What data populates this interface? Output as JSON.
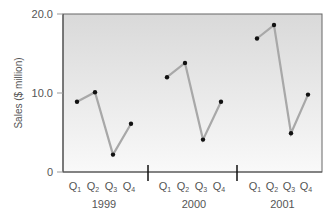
{
  "chart_data": {
    "type": "line",
    "title": "",
    "xlabel": "",
    "ylabel": "Sales ($ million)",
    "ylim": [
      0,
      20
    ],
    "yticks": [
      "0",
      "10.0",
      "20.0"
    ],
    "grid": false,
    "legend": null,
    "groups": [
      {
        "year": "1999",
        "categories": [
          "Q1",
          "Q2",
          "Q3",
          "Q4"
        ],
        "values": [
          8.9,
          10.1,
          2.2,
          6.1
        ]
      },
      {
        "year": "2000",
        "categories": [
          "Q1",
          "Q2",
          "Q3",
          "Q4"
        ],
        "values": [
          12.0,
          13.8,
          4.1,
          8.9
        ]
      },
      {
        "year": "2001",
        "categories": [
          "Q1",
          "Q2",
          "Q3",
          "Q4"
        ],
        "values": [
          16.9,
          18.6,
          4.9,
          9.8
        ]
      }
    ],
    "colors": {
      "line": "#a8a8a8",
      "marker": "#111111",
      "frame": "#555555",
      "plot_bg_top": "#dcdcdc",
      "plot_bg_bottom": "#f8f8f8",
      "text": "#555555"
    }
  },
  "labels": {
    "ylabel": "Sales ($ million)",
    "ytick_0": "0",
    "ytick_10": "10.0",
    "ytick_20": "20.0",
    "q": "Q",
    "subs": [
      "1",
      "2",
      "3",
      "4"
    ],
    "years": [
      "1999",
      "2000",
      "2001"
    ]
  }
}
